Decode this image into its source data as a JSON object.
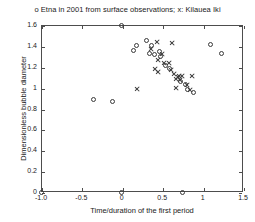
{
  "chart_data": {
    "type": "scatter",
    "title": "o Etna  in 2001 from surface observations; x: Kilauea Iki",
    "xlabel": "Time/duration of the first period",
    "ylabel": "Dimensionless bubble diameter",
    "xlim": [
      -1.0,
      1.5
    ],
    "ylim": [
      0,
      1.6
    ],
    "xticks": [
      -1.0,
      -0.5,
      0,
      0.5,
      1.0,
      1.5
    ],
    "xticklabels": [
      "-1.0",
      "-0.5",
      "0",
      "0.5",
      "1",
      "1.5"
    ],
    "yticks": [
      0,
      0.2,
      0.4,
      0.6,
      0.8,
      1.0,
      1.2,
      1.4,
      1.6
    ],
    "yticklabels": [
      "0",
      "0.2",
      "0.4",
      "0.6",
      "0.8",
      "1",
      "1.2",
      "1.4",
      "1.6"
    ],
    "grid": false,
    "legend_position": "title",
    "series": [
      {
        "name": "Etna  in 2001 from surface observations",
        "marker": "o",
        "color": "#3a3a3a",
        "points": [
          [
            -1.0,
            0.0
          ],
          [
            0.0,
            0.0
          ],
          [
            0.75,
            0.0
          ],
          [
            0.0,
            1.6
          ],
          [
            0.29,
            1.46
          ],
          [
            0.17,
            1.41
          ],
          [
            0.13,
            1.37
          ],
          [
            0.35,
            1.41
          ],
          [
            0.39,
            1.33
          ],
          [
            0.45,
            1.36
          ],
          [
            0.33,
            1.34
          ],
          [
            0.47,
            1.31
          ],
          [
            1.09,
            1.42
          ],
          [
            1.22,
            1.34
          ],
          [
            0.58,
            1.19
          ],
          [
            0.53,
            1.22
          ],
          [
            0.72,
            1.07
          ],
          [
            0.78,
            1.04
          ],
          [
            0.8,
            0.99
          ],
          [
            0.87,
            0.96
          ],
          [
            -0.36,
            0.9
          ],
          [
            -0.13,
            0.88
          ]
        ]
      },
      {
        "name": "Kilauea Iki",
        "marker": "x",
        "color": "#3a3a3a",
        "points": [
          [
            0.42,
            1.45
          ],
          [
            0.61,
            1.44
          ],
          [
            0.35,
            1.38
          ],
          [
            0.44,
            1.27
          ],
          [
            0.51,
            1.25
          ],
          [
            0.57,
            1.25
          ],
          [
            0.49,
            1.33
          ],
          [
            0.4,
            1.19
          ],
          [
            0.44,
            1.16
          ],
          [
            0.6,
            1.18
          ],
          [
            0.63,
            1.14
          ],
          [
            0.68,
            1.11
          ],
          [
            0.7,
            1.12
          ],
          [
            0.71,
            1.08
          ],
          [
            0.66,
            1.09
          ],
          [
            0.73,
            1.12
          ],
          [
            0.66,
            1.01
          ],
          [
            0.79,
            1.03
          ],
          [
            0.83,
            0.99
          ],
          [
            0.17,
            1.0
          ],
          [
            0.86,
            1.12
          ]
        ]
      }
    ]
  }
}
